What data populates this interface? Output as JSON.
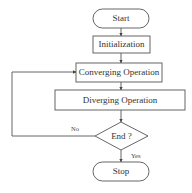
{
  "diagram": {
    "type": "flowchart",
    "colors": {
      "stroke": "#555555",
      "text": "#333333",
      "background": "#ffffff"
    },
    "nodes": [
      {
        "id": "start",
        "shape": "terminal",
        "label": "Start"
      },
      {
        "id": "init",
        "shape": "process",
        "label": "Initialization"
      },
      {
        "id": "converge",
        "shape": "process",
        "label": "Converging Operation"
      },
      {
        "id": "diverge",
        "shape": "process",
        "label": "Diverging Operation"
      },
      {
        "id": "end_check",
        "shape": "decision",
        "label": "End ?"
      },
      {
        "id": "stop",
        "shape": "terminal",
        "label": "Stop"
      }
    ],
    "edges": [
      {
        "from": "start",
        "to": "init",
        "label": ""
      },
      {
        "from": "init",
        "to": "converge",
        "label": ""
      },
      {
        "from": "converge",
        "to": "diverge",
        "label": ""
      },
      {
        "from": "diverge",
        "to": "end_check",
        "label": ""
      },
      {
        "from": "end_check",
        "to": "stop",
        "label": "Yes"
      },
      {
        "from": "end_check",
        "to": "converge",
        "label": "No"
      }
    ],
    "edge_labels": {
      "yes": "Yes",
      "no": "No"
    }
  }
}
